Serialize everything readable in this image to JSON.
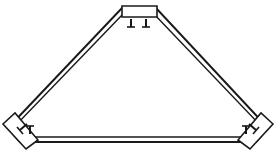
{
  "figure": {
    "type": "technical-line-drawing",
    "style": "patent-figure",
    "background_color": "#ffffff",
    "line_color": "#1a1a1a",
    "interior_fill": "#ffffff",
    "canvas": {
      "width": 276,
      "height": 163
    }
  },
  "shape": {
    "name": "triangular-body",
    "description": "Broad low triangle with flattened apex, drawn as a double-line outline",
    "outer_path": "M 8,128 L 122,8 L 156,8 L 268,128 L 256,142 L 20,142 Z",
    "inner_path": "M 15,126 L 124,13 L 153,13 L 261,126 L 252,137 L 24,137 Z",
    "apex": {
      "x": 139,
      "y": 8
    },
    "bottom_left": {
      "x": 14,
      "y": 135
    },
    "bottom_right": {
      "x": 262,
      "y": 135
    },
    "stroke_width": 2
  },
  "tabs": [
    {
      "id": "apex-tab",
      "name": "apex-mounting-tab",
      "position": "top-center",
      "shape": "rectangle",
      "path": "M 122,7 L 156,7 L 156,17 L 122,17 Z",
      "rotation_deg": 0,
      "stroke_width": 1.6
    },
    {
      "id": "left-tab",
      "name": "bottom-left-mounting-tab",
      "position": "bottom-left",
      "shape": "rectangle",
      "path": "M 4,122 L 20,108 L 36,136 L 20,145 Z",
      "rotation_deg": 42,
      "stroke_width": 1.6
    },
    {
      "id": "right-tab",
      "name": "bottom-right-mounting-tab",
      "position": "bottom-right",
      "shape": "rectangle",
      "path": "M 272,122 L 256,108 L 240,136 L 256,145 Z",
      "rotation_deg": -42,
      "stroke_width": 1.6
    }
  ],
  "tick_marks": [
    {
      "id": "apex-tick-left",
      "name": "apex-reference-tick-left",
      "group": "apex",
      "stem": {
        "x1": 131,
        "y1": 19,
        "x2": 131,
        "y2": 27
      },
      "serif": {
        "x1": 127,
        "y1": 27,
        "x2": 135,
        "y2": 27
      },
      "orientation": "vertical"
    },
    {
      "id": "apex-tick-right",
      "name": "apex-reference-tick-right",
      "group": "apex",
      "stem": {
        "x1": 146,
        "y1": 19,
        "x2": 146,
        "y2": 27
      },
      "serif": {
        "x1": 142,
        "y1": 27,
        "x2": 150,
        "y2": 27
      },
      "orientation": "vertical"
    },
    {
      "id": "left-tick-outer",
      "name": "bottom-left-reference-tick-outer",
      "group": "bottom-left",
      "stem": {
        "x1": 20,
        "y1": 130,
        "x2": 27,
        "y2": 124
      },
      "serif": {
        "x1": 17,
        "y1": 127,
        "x2": 23,
        "y2": 134
      },
      "orientation": "diagonal"
    },
    {
      "id": "left-tick-inner",
      "name": "bottom-left-reference-tick-inner",
      "group": "bottom-left",
      "stem": {
        "x1": 30,
        "y1": 134,
        "x2": 30,
        "y2": 126
      },
      "serif": {
        "x1": 26,
        "y1": 126,
        "x2": 34,
        "y2": 126
      },
      "orientation": "vertical"
    },
    {
      "id": "right-tick-outer",
      "name": "bottom-right-reference-tick-outer",
      "group": "bottom-right",
      "stem": {
        "x1": 256,
        "y1": 130,
        "x2": 249,
        "y2": 124
      },
      "serif": {
        "x1": 259,
        "y1": 127,
        "x2": 253,
        "y2": 134
      },
      "orientation": "diagonal"
    },
    {
      "id": "right-tick-inner",
      "name": "bottom-right-reference-tick-inner",
      "group": "bottom-right",
      "stem": {
        "x1": 246,
        "y1": 134,
        "x2": 246,
        "y2": 126
      },
      "serif": {
        "x1": 242,
        "y1": 126,
        "x2": 250,
        "y2": 126
      },
      "orientation": "vertical"
    }
  ],
  "labels": {
    "apex_group": "",
    "left_group": "",
    "right_group": "",
    "caption": ""
  }
}
